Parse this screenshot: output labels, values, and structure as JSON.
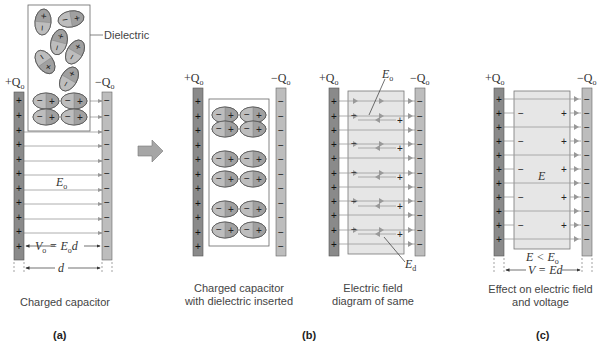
{
  "panels": {
    "a": {
      "letter": "(a)",
      "caption": "Charged capacitor",
      "dielectric_label": "Dielectric",
      "plus_charge": "+Q",
      "minus_charge": "−Q",
      "charge_sub": "o",
      "field_label": "E",
      "field_sub": "o",
      "voltage_eq_left": "V",
      "voltage_eq_sub": "o",
      "voltage_eq_mid": " = E",
      "voltage_eq_sub2": "o",
      "voltage_eq_right": "d",
      "distance_label": "d"
    },
    "b": {
      "letter": "(b)",
      "caption_1_line1": "Charged capacitor",
      "caption_1_line2": "with dielectric inserted",
      "caption_2_line1": "Electric field",
      "caption_2_line2": "diagram of same",
      "plus_charge": "+Q",
      "minus_charge": "−Q",
      "charge_sub": "o",
      "field_label_top": "E",
      "field_label_top_sub": "o",
      "field_label_bottom": "E",
      "field_label_bottom_sub": "d"
    },
    "c": {
      "letter": "(c)",
      "caption_line1": "Effect on electric field",
      "caption_line2": "and voltage",
      "plus_charge": "+Q",
      "minus_charge": "−Q",
      "charge_sub": "o",
      "field_label": "E",
      "inequality_left": "E < E",
      "inequality_sub": "o",
      "voltage_eq": "V = Ed"
    }
  },
  "colors": {
    "positive_plate": "#8a8a8a",
    "negative_plate": "#bdbdbd",
    "dielectric_fill": "#e6e6e6",
    "molecule_dark": "#9a9a9a",
    "molecule_light": "#c8c8c8",
    "field_line": "#999999",
    "arrow_block": "#a6a6a6"
  }
}
